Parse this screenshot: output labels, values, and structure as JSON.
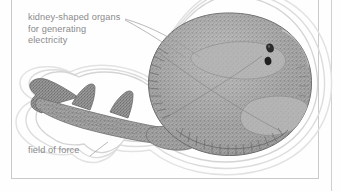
{
  "figure": {
    "type": "scanned-book-illustration",
    "background_color": "#fefefe",
    "frame": {
      "line_color": "#c9c9c9",
      "page_edge_rule_color": "#cfcfcf"
    },
    "labels": [
      {
        "id": "organs",
        "text": "kidney-shaped organs\nfor generating\nelectricity",
        "color": "#8a8a8c",
        "leader_lines": 2
      },
      {
        "id": "field",
        "text": "field of force",
        "color": "#8a8a8c",
        "leader_lines": 1
      }
    ],
    "elements": {
      "body_fill": "#9a9a9a",
      "organ_fill": "#b4b4b4",
      "outline_color": "#6f6f6f",
      "field_contour_color": "#d8d8d8",
      "field_contour_count": 3,
      "eye_count": 2,
      "dorsal_fin_count": 2,
      "caudal_fin": "present",
      "fin_ray_margin": "radiating lines along disc edge"
    }
  }
}
